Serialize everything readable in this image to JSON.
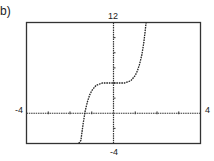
{
  "panel_label": "b)",
  "chart_data": {
    "type": "line",
    "title": "",
    "xlabel": "",
    "ylabel": "",
    "xlim": [
      -4,
      4
    ],
    "ylim": [
      -4,
      12
    ],
    "x_tick_step": 1,
    "y_tick_step": 2,
    "grid": false,
    "legend": null,
    "window_labels": {
      "xmin": "-4",
      "xmax": "4",
      "ymin": "-4",
      "ymax": "12"
    },
    "series": [
      {
        "name": "f(x)",
        "style": "dotted",
        "x": [
          -1.6,
          -1.5,
          -1.4,
          -1.3,
          -1.2,
          -1.1,
          -1.0,
          -0.8,
          -0.5,
          0,
          0.5,
          0.8,
          1.0,
          1.1,
          1.2,
          1.3,
          1.4,
          1.5
        ],
        "y": [
          -4,
          -3.6,
          -1.4,
          0.3,
          1.5,
          2.4,
          3.0,
          3.7,
          4.0,
          4.0,
          4.0,
          4.3,
          5.0,
          5.6,
          6.5,
          7.7,
          9.4,
          12
        ]
      }
    ]
  }
}
